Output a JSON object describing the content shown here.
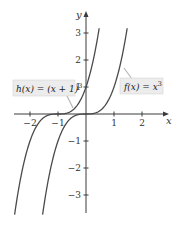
{
  "chart_data": {
    "type": "line",
    "title": "",
    "xlabel": "x",
    "ylabel": "y",
    "xlim": [
      -2.6,
      2.9
    ],
    "ylim": [
      -3.7,
      3.8
    ],
    "grid": false,
    "x_ticks": [
      -2,
      -1,
      1,
      2
    ],
    "y_ticks": [
      -3,
      -2,
      -1,
      1,
      2,
      3
    ],
    "x_tick_labels": [
      "−2",
      "−1",
      "1",
      "2"
    ],
    "y_tick_labels": [
      "−3",
      "−2",
      "−1",
      "1",
      "2",
      "3"
    ],
    "series": [
      {
        "name": "h(x) = (x + 1)^3",
        "label": "h(x) = (x + 1)",
        "exponent": "3",
        "formula": "(x+1)^3",
        "x_range": [
          -2.55,
          0.47
        ],
        "x": [
          -2.5,
          -2,
          -1.5,
          -1,
          -0.5,
          0,
          0.47
        ],
        "values": [
          -3.375,
          -1,
          -0.125,
          0,
          0.125,
          1,
          3.18
        ]
      },
      {
        "name": "f(x) = x^3",
        "label": "f(x) = x",
        "exponent": "3",
        "formula": "x^3",
        "x_range": [
          -1.55,
          1.47
        ],
        "x": [
          -1.5,
          -1,
          -0.5,
          0,
          0.5,
          1,
          1.47
        ],
        "values": [
          -3.375,
          -1,
          -0.125,
          0,
          0.125,
          1,
          3.18
        ]
      }
    ],
    "annotations": [
      {
        "text": "h(x) = (x + 1)^3",
        "position": "left of y-axis, above x-axis",
        "points_to": "h curve"
      },
      {
        "text": "f(x) = x^3",
        "position": "right, above x-axis",
        "points_to": "f curve"
      }
    ]
  },
  "labels": {
    "x_axis": "x",
    "y_axis": "y",
    "h_label_main": "h(x) = (x + 1)",
    "h_label_exp": "3",
    "f_label_main": "f(x) = x",
    "f_label_exp": "3"
  },
  "colors": {
    "curve": "#4a4a4a",
    "axis": "#3a3a3a",
    "label_box": "#ececec",
    "leader": "#b8b8b8"
  }
}
